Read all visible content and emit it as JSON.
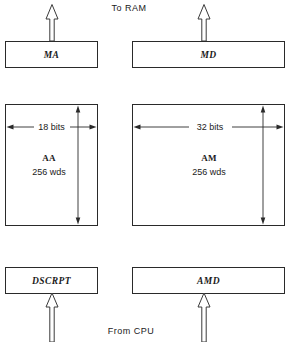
{
  "diagram": {
    "background_color": "#ffffff",
    "line_color": "#2a2a2a",
    "flow_labels": {
      "top": "To RAM",
      "bottom": "From CPU"
    },
    "registers": [
      {
        "id": "ma",
        "label": "MA",
        "column": "left",
        "row": "top"
      },
      {
        "id": "md",
        "label": "MD",
        "column": "right",
        "row": "top"
      },
      {
        "id": "dscrpt",
        "label": "DSCRPT",
        "column": "left",
        "row": "bottom"
      },
      {
        "id": "amd",
        "label": "AMD",
        "column": "right",
        "row": "bottom"
      }
    ],
    "arrays": [
      {
        "id": "aa",
        "name": "AA",
        "width_label": "18 bits",
        "depth_label": "256 wds",
        "column": "left"
      },
      {
        "id": "am",
        "name": "AM",
        "width_label": "32 bits",
        "depth_label": "256 wds",
        "column": "right"
      }
    ],
    "arrows": [
      {
        "id": "ma-to-ram",
        "direction": "up",
        "style": "hollow",
        "from": "MA",
        "to": "To RAM"
      },
      {
        "id": "md-to-ram",
        "direction": "up",
        "style": "hollow",
        "from": "MD",
        "to": "To RAM"
      },
      {
        "id": "cpu-to-dscrpt",
        "direction": "up",
        "style": "hollow",
        "from": "From CPU",
        "to": "DSCRPT"
      },
      {
        "id": "cpu-to-amd",
        "direction": "up",
        "style": "hollow",
        "from": "From CPU",
        "to": "AMD"
      }
    ]
  }
}
